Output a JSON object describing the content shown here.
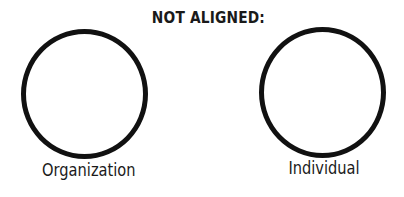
{
  "diagram": {
    "title": "NOT ALIGNED:",
    "nodes": [
      {
        "id": "organization",
        "label": "Organization",
        "shape": "circle"
      },
      {
        "id": "individual",
        "label": "Individual",
        "shape": "circle"
      }
    ],
    "colors": {
      "stroke": "#111111",
      "text": "#1a1a1a",
      "background": "#ffffff"
    }
  }
}
